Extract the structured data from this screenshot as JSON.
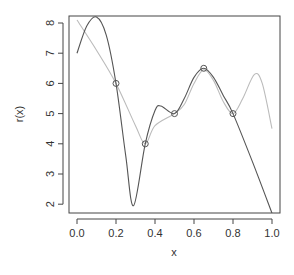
{
  "chart_data": {
    "type": "line",
    "title": "",
    "xlabel": "x",
    "ylabel": "r(x)",
    "xlim": [
      0.0,
      1.0
    ],
    "ylim": [
      2,
      8.2
    ],
    "grid": false,
    "legend": null,
    "x_ticks": [
      "0.0",
      "0.2",
      "0.4",
      "0.6",
      "0.8",
      "1.0"
    ],
    "y_ticks": [
      "2",
      "3",
      "4",
      "5",
      "6",
      "7",
      "8"
    ],
    "series": [
      {
        "name": "interpolating polynomial",
        "style": "dark-gray line",
        "color": "#555555",
        "x": [
          0.0,
          0.05,
          0.1,
          0.15,
          0.2,
          0.25,
          0.29,
          0.35,
          0.4,
          0.43,
          0.5,
          0.55,
          0.6,
          0.65,
          0.7,
          0.75,
          0.8,
          0.9,
          1.0
        ],
        "y": [
          7.0,
          7.9,
          8.2,
          7.6,
          6.0,
          3.6,
          1.95,
          4.0,
          5.1,
          5.25,
          5.0,
          5.5,
          6.2,
          6.5,
          6.2,
          5.6,
          5.0,
          3.4,
          1.7
        ]
      },
      {
        "name": "true function",
        "style": "light-gray line",
        "color": "#bbbbbb",
        "x": [
          0.0,
          0.1,
          0.2,
          0.3,
          0.35,
          0.4,
          0.5,
          0.55,
          0.6,
          0.65,
          0.7,
          0.75,
          0.8,
          0.85,
          0.91,
          0.95,
          1.0
        ],
        "y": [
          8.1,
          7.1,
          6.0,
          4.6,
          4.0,
          4.6,
          5.0,
          5.3,
          6.0,
          6.45,
          6.1,
          5.4,
          5.0,
          5.5,
          6.3,
          6.0,
          4.5
        ]
      },
      {
        "name": "interpolation nodes",
        "style": "open circles",
        "color": "#555555",
        "x": [
          0.2,
          0.35,
          0.5,
          0.65,
          0.8
        ],
        "y": [
          6.0,
          4.0,
          5.0,
          6.5,
          5.0
        ]
      }
    ]
  }
}
